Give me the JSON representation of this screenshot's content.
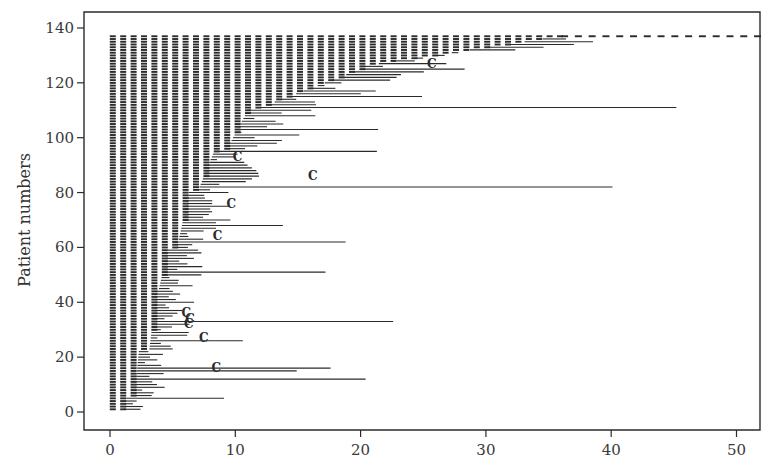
{
  "chart_data": {
    "type": "swimmer",
    "title": "",
    "xlabel": "",
    "ylabel": "Patient numbers",
    "xlim": [
      -3,
      52
    ],
    "ylim": [
      -5,
      145
    ],
    "xticks": [
      0,
      10,
      20,
      30,
      40,
      50
    ],
    "yticks": [
      0,
      20,
      40,
      60,
      80,
      100,
      120,
      140
    ],
    "grid": false,
    "legend": null,
    "n_patients": 137,
    "ink_color": "#2b2b2b",
    "segments": [
      {
        "from": 1,
        "to": 5,
        "dashed_end": 1.3,
        "line_end_range": [
          2.7,
          9.2
        ]
      },
      {
        "from": 6,
        "to": 22,
        "dashed_end": 2.3,
        "line_end_range": [
          3.0,
          20.5
        ]
      },
      {
        "from": 23,
        "to": 44,
        "dashed_end": 3.7,
        "line_end_range": [
          4.0,
          22.5
        ]
      },
      {
        "from": 45,
        "to": 59,
        "dashed_end": 4.6,
        "line_end_range": [
          5.0,
          17.2
        ]
      },
      {
        "from": 60,
        "to": 80,
        "dashed_end": 6.3,
        "line_end_range": [
          6.5,
          18.8
        ]
      },
      {
        "from": 81,
        "to": 95,
        "dashed_end": 8.3,
        "line_end_range": [
          8.5,
          40.0
        ]
      },
      {
        "from": 96,
        "to": 110,
        "dashed_end": 11.0,
        "line_end_range": [
          11.2,
          21.5
        ]
      },
      {
        "from": 111,
        "to": 125,
        "dashed_end": 16.0,
        "line_end_range": [
          16.5,
          45.2
        ]
      },
      {
        "from": 126,
        "to": 137,
        "dashed_end": 30.0,
        "line_end_range": [
          30,
          52
        ]
      }
    ],
    "long_lines": [
      {
        "patient": 5,
        "end": 9.1
      },
      {
        "patient": 12,
        "end": 20.4
      },
      {
        "patient": 15,
        "end": 14.9
      },
      {
        "patient": 16,
        "end": 17.6
      },
      {
        "patient": 26,
        "end": 10.6
      },
      {
        "patient": 33,
        "end": 22.6
      },
      {
        "patient": 51,
        "end": 17.2
      },
      {
        "patient": 62,
        "end": 18.8
      },
      {
        "patient": 68,
        "end": 13.8
      },
      {
        "patient": 82,
        "end": 40.1
      },
      {
        "patient": 95,
        "end": 21.3
      },
      {
        "patient": 103,
        "end": 21.4
      },
      {
        "patient": 111,
        "end": 45.2
      },
      {
        "patient": 115,
        "end": 24.9
      },
      {
        "patient": 125,
        "end": 28.3
      },
      {
        "patient": 133,
        "end": 34.6
      },
      {
        "patient": 136,
        "end": 36.4
      },
      {
        "patient": 137,
        "end": 52.0
      }
    ],
    "censor_marks": [
      {
        "patient": 16,
        "x": 8.1
      },
      {
        "patient": 27,
        "x": 7.1
      },
      {
        "patient": 32,
        "x": 5.9
      },
      {
        "patient": 34,
        "x": 6.0
      },
      {
        "patient": 36,
        "x": 5.7
      },
      {
        "patient": 64,
        "x": 8.2
      },
      {
        "patient": 76,
        "x": 9.3
      },
      {
        "patient": 86,
        "x": 15.8
      },
      {
        "patient": 93,
        "x": 9.8
      },
      {
        "patient": 127,
        "x": 25.3
      }
    ],
    "censor_symbol": "C"
  },
  "axes": {
    "ylabel": "Patient numbers",
    "xtick_labels": [
      "0",
      "10",
      "20",
      "30",
      "40",
      "50"
    ],
    "ytick_labels": [
      "0",
      "20",
      "40",
      "60",
      "80",
      "100",
      "120",
      "140"
    ]
  }
}
